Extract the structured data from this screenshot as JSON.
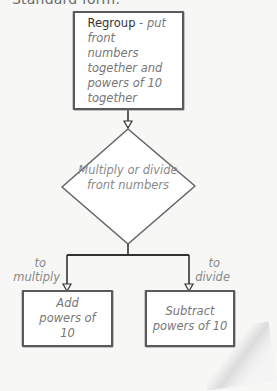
{
  "heading": "Standard form.",
  "flowchart": {
    "step1": {
      "strong": "Regroup",
      "rest": " - put front numbers together and powers of 10 together"
    },
    "decision": {
      "text": "Multiply or divide front numbers"
    },
    "branches": [
      {
        "label_line1": "to",
        "label_line2": "multiply",
        "result": "Add powers of 10"
      },
      {
        "label_line1": "to",
        "label_line2": "divide",
        "result": "Subtract powers of 10"
      }
    ]
  },
  "colors": {
    "background": "#f7f7f6",
    "box_border": "#5a5a5a",
    "text_gray": "#777777",
    "text_dark": "#333333"
  }
}
